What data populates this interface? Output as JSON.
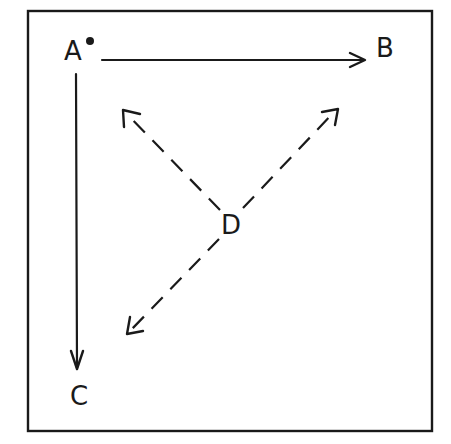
{
  "diagram": {
    "frame": {
      "x": 28,
      "y": 11,
      "width": 404,
      "height": 420
    },
    "nodes": [
      {
        "id": "A",
        "label": "A",
        "x": 75,
        "y": 59,
        "marker": "dot"
      },
      {
        "id": "B",
        "label": "B",
        "x": 386,
        "y": 56
      },
      {
        "id": "C",
        "label": "C",
        "x": 80,
        "y": 405
      },
      {
        "id": "D",
        "label": "D",
        "x": 232,
        "y": 234
      }
    ],
    "edges": [
      {
        "from": "A",
        "to": "B",
        "style": "solid",
        "arrow": "end"
      },
      {
        "from": "A",
        "to": "C",
        "style": "solid",
        "arrow": "end"
      },
      {
        "from": "D",
        "to": "upper-left",
        "style": "dashed",
        "arrow": "end"
      },
      {
        "from": "D",
        "to": "upper-right",
        "style": "dashed",
        "arrow": "end"
      },
      {
        "from": "D",
        "to": "lower-left",
        "style": "dashed",
        "arrow": "end"
      }
    ],
    "colors": {
      "ink": "#1a1a1a",
      "background": "#ffffff"
    }
  }
}
